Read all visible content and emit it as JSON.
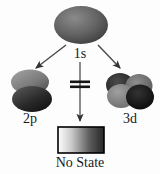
{
  "figure": {
    "type": "orbital-transition-diagram",
    "background_color": "#fdfdfd",
    "width": 160,
    "height": 174
  },
  "nodes": {
    "source": {
      "id": "1s",
      "label": "1s",
      "icon_name": "s-orbital-ellipse",
      "shape": "ellipse",
      "fill_light": "#7d7d7d",
      "fill_dark": "#3f3f3f",
      "cx": 81,
      "cy": 25,
      "rx": 27,
      "ry": 19
    },
    "left_target": {
      "id": "2p",
      "label": "2p",
      "icon_name": "p-orbital-dumbbell",
      "shape": "two-stacked-lobes",
      "lobe_top_light": "#9a9a9a",
      "lobe_top_dark": "#5c5c5c",
      "lobe_bottom_light": "#4a4a4a",
      "lobe_bottom_dark": "#111111",
      "cx": 30,
      "cy": 93
    },
    "right_target": {
      "id": "3d",
      "label": "3d",
      "icon_name": "d-orbital-cloverleaf",
      "shape": "four-overlapping-lobes",
      "lobe_a_fill": "#2a2a2a",
      "lobe_b_fill": "#808080",
      "lobe_c_fill": "#6a6a6a",
      "lobe_d_fill": "#151515",
      "cx": 128,
      "cy": 92
    },
    "blocked_target": {
      "id": "no-state",
      "label": "No State",
      "icon_name": "gradient-continuum-bar",
      "shape": "rectangle",
      "gradient_from": "#ffffff",
      "gradient_to": "#2b2b2b",
      "border_color": "#000000",
      "x": 58,
      "y": 127,
      "width": 46,
      "height": 26
    }
  },
  "arrows": {
    "to_2p": {
      "icon_name": "arrow-down-left-icon",
      "from_x": 65,
      "from_y": 44,
      "to_x": 34,
      "to_y": 69,
      "color": "#4a4a4a",
      "blocked": false
    },
    "to_3d": {
      "icon_name": "arrow-down-right-icon",
      "from_x": 99,
      "from_y": 44,
      "to_x": 122,
      "to_y": 69,
      "color": "#4a4a4a",
      "blocked": false
    },
    "to_no_state": {
      "icon_name": "arrow-down-blocked-icon",
      "from_x": 80,
      "from_y": 62,
      "to_x": 80,
      "to_y": 123,
      "color": "#4a4a4a",
      "blocked": true,
      "barrier_icon_name": "double-bar-barrier-icon",
      "barrier_y": 84,
      "barrier_half_width": 10,
      "barrier_color": "#1a1a1a"
    }
  }
}
